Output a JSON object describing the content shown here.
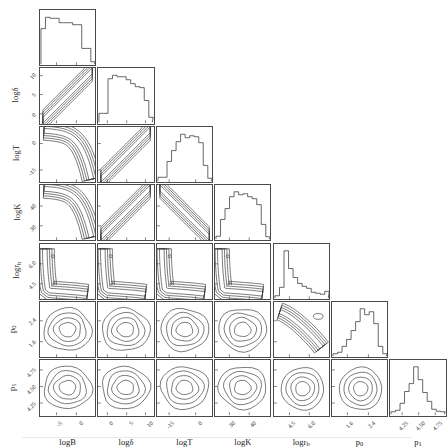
{
  "figure": {
    "type": "corner-plot",
    "n_params": 7,
    "grid_origin": {
      "x": 39,
      "y": 9
    },
    "cell": 57.2,
    "gap": 1.2,
    "rule_y": 437
  },
  "chart_data": {
    "type": "scatter",
    "subtype": "corner-plot-contour-matrix",
    "title": "",
    "xlabel": "",
    "ylabel": "",
    "grid": false,
    "legend_position": "none",
    "parameters": [
      {
        "key": "logB",
        "label": "logB",
        "label_text": "logB",
        "ticks": [
          -5,
          0
        ],
        "tick_labels": [
          "-5",
          "0"
        ],
        "tick_pos": [
          0.3,
          0.66
        ],
        "range": [
          -8.0,
          2.0
        ],
        "marginal": {
          "type": "histogram",
          "bins": [
            0.72,
            0.95,
            0.93,
            0.93,
            0.84,
            0.84,
            0.84,
            0.8,
            0.8,
            0.32,
            0.32,
            0.05
          ]
        }
      },
      {
        "key": "logdelta",
        "label": "logδ",
        "label_text": "logδ",
        "ticks": [
          0,
          5,
          10
        ],
        "tick_labels": [
          "0",
          "5",
          "10"
        ],
        "tick_pos": [
          0.17,
          0.52,
          0.86
        ],
        "range": [
          -2.0,
          12.5
        ],
        "marginal": {
          "type": "histogram",
          "bins": [
            0.18,
            0.18,
            0.88,
            0.95,
            0.92,
            0.92,
            0.86,
            0.78,
            0.72,
            0.7,
            0.44,
            0.1
          ]
        }
      },
      {
        "key": "logT",
        "label": "logT",
        "label_text": "logT",
        "ticks": [
          -15,
          0
        ],
        "tick_labels": [
          "-15",
          "0"
        ],
        "tick_pos": [
          0.22,
          0.7
        ],
        "range": [
          -21.0,
          5.0
        ],
        "marginal": {
          "type": "histogram",
          "bins": [
            0.08,
            0.08,
            0.4,
            0.62,
            0.8,
            0.95,
            0.88,
            0.92,
            0.9,
            0.78,
            0.32,
            0.06
          ]
        }
      },
      {
        "key": "logK",
        "label": "logK",
        "label_text": "logK",
        "ticks": [
          30,
          40
        ],
        "tick_labels": [
          "30",
          "40"
        ],
        "tick_pos": [
          0.26,
          0.62
        ],
        "range": [
          24.0,
          48.0
        ],
        "marginal": {
          "type": "histogram",
          "bins": [
            0.06,
            0.4,
            0.62,
            0.86,
            0.96,
            0.9,
            0.92,
            0.86,
            0.82,
            0.7,
            0.3,
            0.05
          ]
        }
      },
      {
        "key": "logrb",
        "label": "logrₕ",
        "label_text": "logr_b",
        "ticks": [
          4.5,
          6.0
        ],
        "tick_labels": [
          "4.5",
          "6.0"
        ],
        "tick_pos": [
          0.28,
          0.64
        ],
        "range": [
          3.3,
          7.6
        ],
        "marginal": {
          "type": "histogram",
          "bins": [
            0.05,
            0.22,
            0.96,
            0.6,
            0.42,
            0.3,
            0.24,
            0.2,
            0.12,
            0.1,
            0.08,
            0.14
          ]
        }
      },
      {
        "key": "p0",
        "label": "p₀",
        "label_text": "p0",
        "ticks": [
          1.6,
          2.4
        ],
        "tick_labels": [
          "1.6",
          "2.4"
        ],
        "tick_pos": [
          0.28,
          0.66
        ],
        "range": [
          1.1,
          3.0
        ],
        "marginal": {
          "type": "histogram",
          "bins": [
            0.05,
            0.08,
            0.2,
            0.34,
            0.52,
            0.7,
            0.96,
            0.84,
            0.9,
            0.66,
            0.2,
            0.05
          ]
        }
      },
      {
        "key": "p1",
        "label": "p₁",
        "label_text": "p1",
        "ticks": [
          4.25,
          4.5,
          4.75
        ],
        "tick_labels": [
          "4.25",
          "4.50",
          "4.75"
        ],
        "tick_pos": [
          0.22,
          0.52,
          0.82
        ],
        "range": [
          4.1,
          4.9
        ],
        "marginal": {
          "type": "histogram",
          "bins": [
            0.05,
            0.08,
            0.22,
            0.46,
            0.62,
            0.96,
            0.7,
            0.44,
            0.26,
            0.1,
            0.06,
            0.05
          ]
        }
      }
    ],
    "contour_levels": [
      0.39,
      0.68,
      0.86,
      0.95
    ],
    "joint_panels": [
      {
        "row": "logdelta",
        "col": "logB",
        "shape": "anticorrelated-band"
      },
      {
        "row": "logT",
        "col": "logB",
        "shape": "hook-band"
      },
      {
        "row": "logT",
        "col": "logdelta",
        "shape": "anticorrelated-band"
      },
      {
        "row": "logK",
        "col": "logB",
        "shape": "hook-band"
      },
      {
        "row": "logK",
        "col": "logdelta",
        "shape": "anticorrelated-band"
      },
      {
        "row": "logK",
        "col": "logT",
        "shape": "correlated-band"
      },
      {
        "row": "logrb",
        "col": "logB",
        "shape": "l-shaped-banana"
      },
      {
        "row": "logrb",
        "col": "logdelta",
        "shape": "l-shaped-banana"
      },
      {
        "row": "logrb",
        "col": "logT",
        "shape": "l-shaped-banana"
      },
      {
        "row": "logrb",
        "col": "logK",
        "shape": "l-shaped-banana"
      },
      {
        "row": "p0",
        "col": "logB",
        "shape": "broad-blob"
      },
      {
        "row": "p0",
        "col": "logdelta",
        "shape": "broad-blob"
      },
      {
        "row": "p0",
        "col": "logT",
        "shape": "broad-blob"
      },
      {
        "row": "p0",
        "col": "logK",
        "shape": "broad-blob"
      },
      {
        "row": "p0",
        "col": "logrb",
        "shape": "curved-banana-with-island"
      },
      {
        "row": "p1",
        "col": "logB",
        "shape": "broad-blob"
      },
      {
        "row": "p1",
        "col": "logdelta",
        "shape": "broad-blob"
      },
      {
        "row": "p1",
        "col": "logT",
        "shape": "broad-blob"
      },
      {
        "row": "p1",
        "col": "logK",
        "shape": "broad-blob"
      },
      {
        "row": "p1",
        "col": "logrb",
        "shape": "round-blob"
      },
      {
        "row": "p1",
        "col": "p0",
        "shape": "round-blob"
      }
    ]
  }
}
